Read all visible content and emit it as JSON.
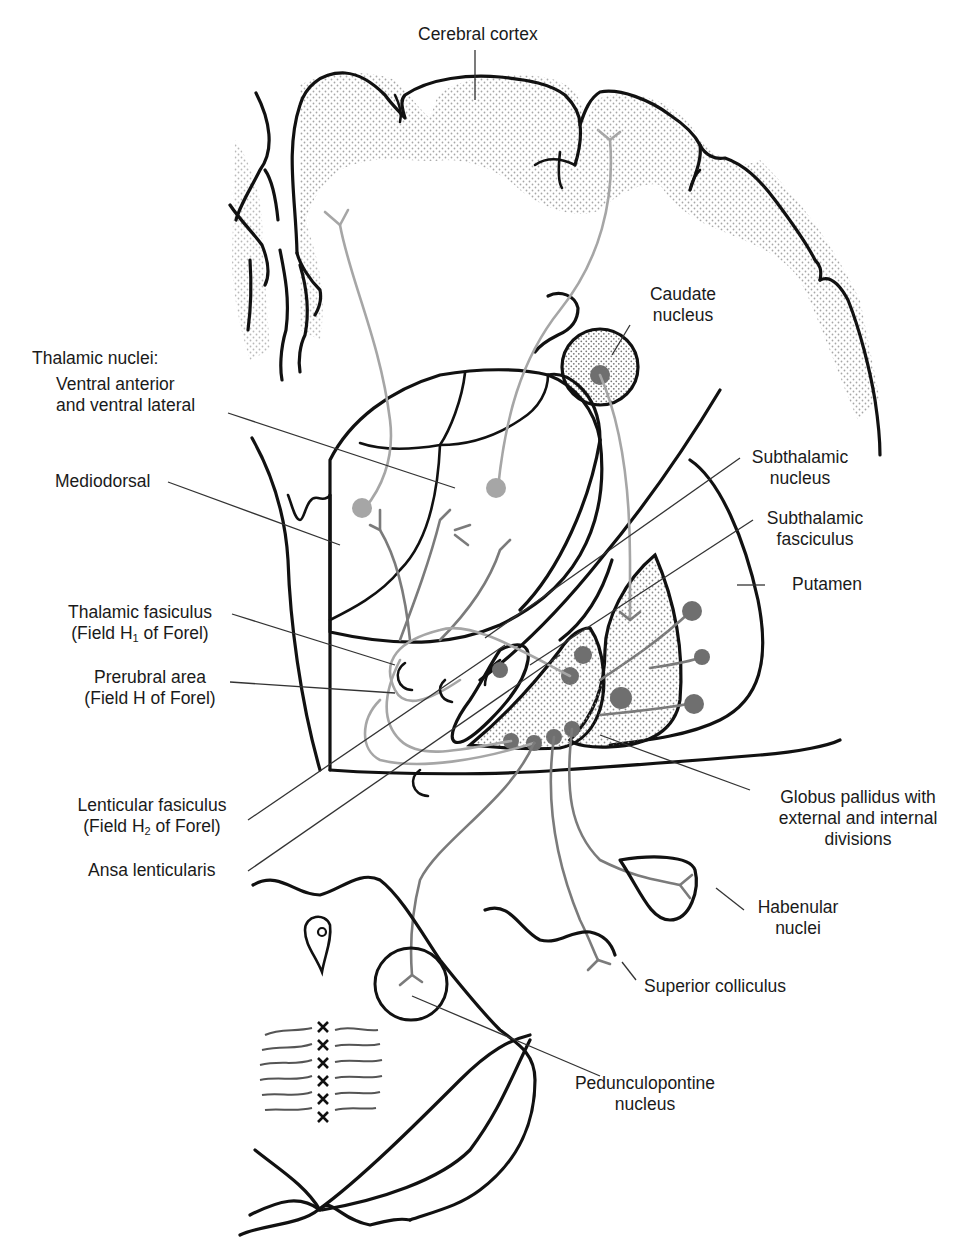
{
  "figure": {
    "colors": {
      "outline": "#111111",
      "fiber_light": "#a6a6a6",
      "fiber_dark": "#7b7b7b",
      "stipple": "#9a9a9a",
      "background": "#ffffff"
    }
  },
  "labels": {
    "cerebral_cortex": "Cerebral cortex",
    "caudate_1": "Caudate",
    "caudate_2": "nucleus",
    "thalamic_nuclei": "Thalamic nuclei:",
    "va_vl_1": "Ventral anterior",
    "va_vl_2": "and ventral lateral",
    "mediodorsal": "Mediodorsal",
    "subthalamic_nucleus_1": "Subthalamic",
    "subthalamic_nucleus_2": "nucleus",
    "subthalamic_fasciculus_1": "Subthalamic",
    "subthalamic_fasciculus_2": "fasciculus",
    "putamen": "Putamen",
    "thalamic_fasiculus_1": "Thalamic fasiculus",
    "thalamic_fasiculus_2a": "(Field H",
    "thalamic_fasiculus_2sub": "1",
    "thalamic_fasiculus_2b": " of Forel)",
    "prerubral_1": "Prerubral area",
    "prerubral_2": "(Field H of Forel)",
    "lenticular_fasiculus_1": "Lenticular fasiculus",
    "lenticular_fasiculus_2a": "(Field H",
    "lenticular_fasiculus_2sub": "2",
    "lenticular_fasiculus_2b": " of Forel)",
    "ansa_lenticularis": "Ansa lenticularis",
    "globus_pallidus_1": "Globus pallidus with",
    "globus_pallidus_2": "external and internal",
    "globus_pallidus_3": "divisions",
    "habenular_1": "Habenular",
    "habenular_2": "nuclei",
    "superior_colliculus": "Superior colliculus",
    "pedunculopontine_1": "Pedunculopontine",
    "pedunculopontine_2": "nucleus"
  }
}
